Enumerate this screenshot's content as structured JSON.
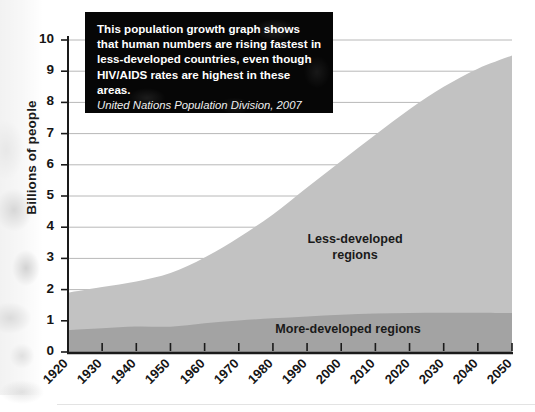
{
  "chart_data": {
    "type": "area",
    "title": "",
    "subtitle": "",
    "xlabel": "",
    "ylabel": "Billions of people",
    "stacked": true,
    "grid": true,
    "legend_position": "inline-annotations",
    "xlim": [
      1920,
      2050
    ],
    "ylim": [
      0,
      10
    ],
    "x": [
      1920,
      1930,
      1940,
      1950,
      1960,
      1970,
      1980,
      1990,
      2000,
      2010,
      2020,
      2030,
      2040,
      2050
    ],
    "xticklabels": [
      "1920",
      "1930",
      "1940",
      "1950",
      "1960",
      "1970",
      "1980",
      "1990",
      "2000",
      "2010",
      "2020",
      "2030",
      "2040",
      "2050"
    ],
    "yticklabels": [
      "0",
      "1",
      "2",
      "3",
      "4",
      "5",
      "6",
      "7",
      "8",
      "9",
      "10"
    ],
    "series": [
      {
        "name": "More-developed regions",
        "color": "#a3a3a3",
        "values": [
          0.7,
          0.76,
          0.82,
          0.81,
          0.92,
          1.01,
          1.08,
          1.14,
          1.19,
          1.23,
          1.25,
          1.26,
          1.26,
          1.25
        ]
      },
      {
        "name": "Less-developed regions",
        "color": "#c2c2c2",
        "values": [
          1.2,
          1.32,
          1.44,
          1.72,
          2.11,
          2.66,
          3.33,
          4.13,
          4.93,
          5.73,
          6.53,
          7.24,
          7.82,
          8.25
        ]
      }
    ],
    "totals": [
      1.9,
      2.08,
      2.26,
      2.53,
      3.03,
      3.67,
      4.41,
      5.27,
      6.12,
      6.96,
      7.78,
      8.5,
      9.08,
      9.5
    ],
    "annotations": [
      {
        "name": "less-developed-regions-label",
        "text": "Less-developed\nregions"
      },
      {
        "name": "more-developed-regions-label",
        "text": "More-developed regions"
      }
    ]
  },
  "callout": {
    "body": "This population growth graph shows that human numbers are rising fastest in less-developed countries, even though HIV/AIDS rates are highest in these areas.",
    "source": "United Nations Population Division, 2007"
  },
  "colors": {
    "less_developed": "#c2c2c2",
    "more_developed": "#a3a3a3",
    "axis": "#1a1a1a",
    "grid": "#b8b8b8",
    "callout_background": "#060606",
    "callout_text": "#ffffff"
  }
}
